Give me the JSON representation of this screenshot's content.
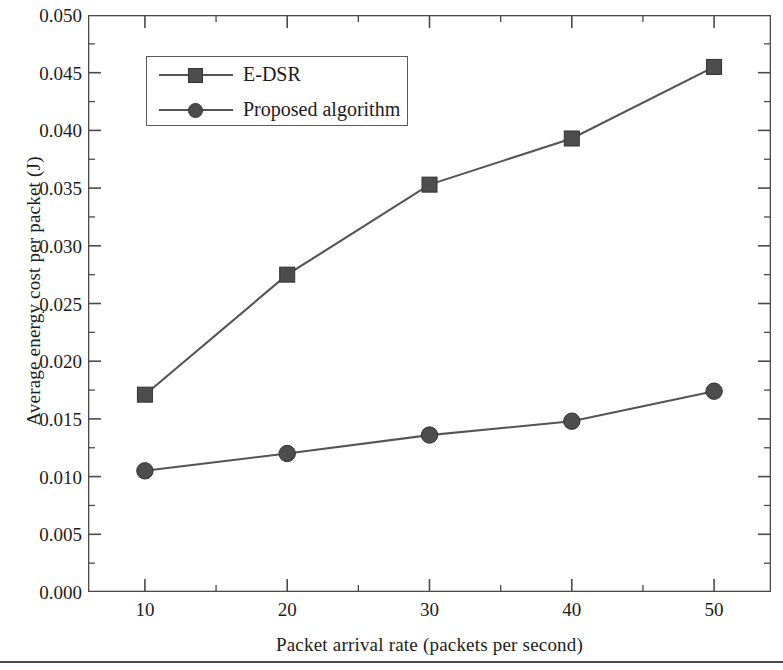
{
  "chart_data": {
    "type": "line",
    "title": "",
    "xlabel": "Packet arrival rate (packets per second)",
    "ylabel": "Average energy cost per packet (J)",
    "x": [
      10,
      20,
      30,
      40,
      50
    ],
    "xlim": [
      6,
      54
    ],
    "ylim": [
      0.0,
      0.05
    ],
    "xticks": [
      "10",
      "20",
      "30",
      "40",
      "50"
    ],
    "yticks": [
      "0.000",
      "0.005",
      "0.010",
      "0.015",
      "0.020",
      "0.025",
      "0.030",
      "0.035",
      "0.040",
      "0.045",
      "0.050"
    ],
    "ytick_values": [
      0.0,
      0.005,
      0.01,
      0.015,
      0.02,
      0.025,
      0.03,
      0.035,
      0.04,
      0.045,
      0.05
    ],
    "y_minor_step": 0.0025,
    "x_minor_step": 5,
    "grid": false,
    "legend_position": "upper-left",
    "line_color": "#545454",
    "marker_color": "#4d4d4d",
    "axis_color": "#4a4a4a",
    "series": [
      {
        "name": "E-DSR",
        "marker": "square",
        "values": [
          0.0171,
          0.0275,
          0.0353,
          0.0393,
          0.0455
        ]
      },
      {
        "name": "Proposed algorithm",
        "marker": "circle",
        "values": [
          0.0105,
          0.012,
          0.0136,
          0.0148,
          0.0174
        ]
      }
    ]
  },
  "legend": {
    "items": [
      {
        "label": "E-DSR",
        "marker": "square"
      },
      {
        "label": "Proposed algorithm",
        "marker": "circle"
      }
    ]
  }
}
